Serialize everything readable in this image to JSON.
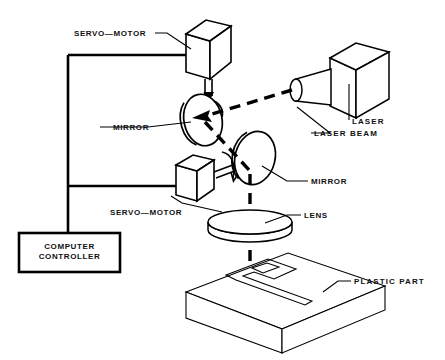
{
  "diagram": {
    "background_color": "#ffffff",
    "line_color": "#000000",
    "labels": {
      "servo_motor_top": "SERVO—MOTOR",
      "servo_motor_bottom": "SERVO—MOTOR",
      "mirror_top": "MIRROR",
      "mirror_bottom": "MIRROR",
      "laser": "LASER",
      "laser_beam": "LASER BEAM",
      "lens": "LENS",
      "plastic_part": "PLASTIC PART",
      "computer_controller_line1": "COMPUTER",
      "computer_controller_line2": "CONTROLLER"
    }
  }
}
